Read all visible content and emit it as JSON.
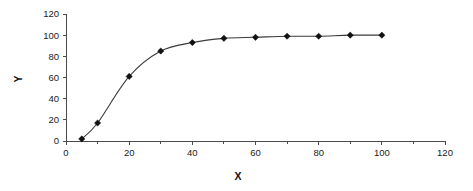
{
  "chart_data": {
    "type": "line",
    "title": "",
    "subtitle": "",
    "xlabel": "X",
    "ylabel": "Y",
    "xlim": [
      0,
      120
    ],
    "ylim": [
      0,
      120
    ],
    "x_ticks": [
      0,
      20,
      40,
      60,
      80,
      100,
      120
    ],
    "y_ticks": [
      0,
      20,
      40,
      60,
      80,
      100,
      120
    ],
    "x_minor_tick_interval": 10,
    "x_tick_labels": [
      "0",
      "20",
      "40",
      "60",
      "80",
      "100",
      "120"
    ],
    "y_tick_labels": [
      "0",
      "20",
      "40",
      "60",
      "80",
      "100",
      "120"
    ],
    "grid": false,
    "legend": false,
    "legend_position": "none",
    "marker": "diamond",
    "line_color": "#3b3b3b",
    "marker_color": "#111111",
    "background_color": "#ffffff",
    "x": [
      5,
      10,
      20,
      30,
      40,
      50,
      60,
      70,
      80,
      90,
      100
    ],
    "series": [
      {
        "name": "Y",
        "values": [
          2,
          17,
          61,
          85,
          93,
          97,
          98,
          99,
          99,
          100,
          100
        ]
      }
    ],
    "points": [
      {
        "x": 5,
        "y": 2
      },
      {
        "x": 10,
        "y": 17
      },
      {
        "x": 20,
        "y": 61
      },
      {
        "x": 30,
        "y": 85
      },
      {
        "x": 40,
        "y": 93
      },
      {
        "x": 50,
        "y": 97
      },
      {
        "x": 60,
        "y": 98
      },
      {
        "x": 70,
        "y": 99
      },
      {
        "x": 80,
        "y": 99
      },
      {
        "x": 90,
        "y": 100
      },
      {
        "x": 100,
        "y": 100
      }
    ],
    "annotations": []
  }
}
